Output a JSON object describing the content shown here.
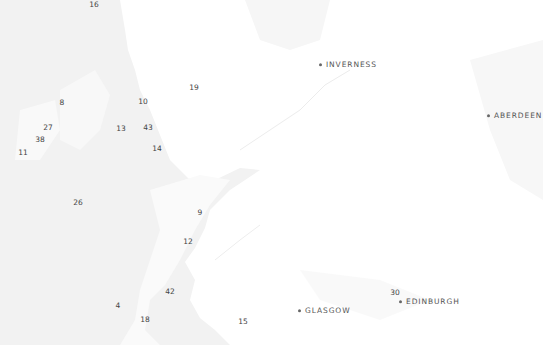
{
  "map": {
    "region": "Scotland",
    "colors": {
      "sea": "#f2f2f2",
      "land": "#ffffff",
      "land_shade": "#f7f7f7",
      "marker_text": "#444444",
      "city_text": "#555555"
    },
    "cities": [
      {
        "name": "INVERNESS",
        "x": 319,
        "y": 65
      },
      {
        "name": "ABERDEEN",
        "x": 487,
        "y": 116
      },
      {
        "name": "GLASGOW",
        "x": 298,
        "y": 311
      },
      {
        "name": "EDINBURGH",
        "x": 399,
        "y": 302
      }
    ],
    "markers": [
      {
        "label": "16",
        "x": 94,
        "y": 5
      },
      {
        "label": "19",
        "x": 194,
        "y": 88
      },
      {
        "label": "8",
        "x": 62,
        "y": 103
      },
      {
        "label": "10",
        "x": 143,
        "y": 102
      },
      {
        "label": "27",
        "x": 48,
        "y": 128
      },
      {
        "label": "13",
        "x": 121,
        "y": 129
      },
      {
        "label": "43",
        "x": 148,
        "y": 128
      },
      {
        "label": "38",
        "x": 40,
        "y": 140
      },
      {
        "label": "11",
        "x": 23,
        "y": 153
      },
      {
        "label": "14",
        "x": 157,
        "y": 149
      },
      {
        "label": "26",
        "x": 78,
        "y": 203
      },
      {
        "label": "9",
        "x": 200,
        "y": 213
      },
      {
        "label": "12",
        "x": 188,
        "y": 242
      },
      {
        "label": "42",
        "x": 170,
        "y": 292
      },
      {
        "label": "4",
        "x": 118,
        "y": 306
      },
      {
        "label": "18",
        "x": 145,
        "y": 320
      },
      {
        "label": "15",
        "x": 243,
        "y": 322
      },
      {
        "label": "30",
        "x": 395,
        "y": 293
      }
    ]
  }
}
